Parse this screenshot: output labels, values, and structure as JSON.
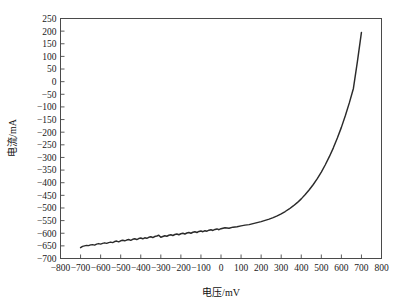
{
  "figure": {
    "background_color": "#ffffff",
    "frame_color": "#4a4a4a",
    "curve_color": "#2b2b2b"
  },
  "chart_data": {
    "type": "line",
    "title": "",
    "xlabel": "电压/mV",
    "ylabel": "电流/mA",
    "xlim": [
      -800,
      800
    ],
    "ylim": [
      -700,
      250
    ],
    "grid": false,
    "legend": null,
    "xticks": [
      -800,
      -700,
      -600,
      -500,
      -400,
      -300,
      -200,
      -100,
      0,
      100,
      200,
      300,
      400,
      500,
      600,
      700,
      800
    ],
    "yticks": [
      -700,
      -650,
      -600,
      -550,
      -500,
      -450,
      -400,
      -350,
      -300,
      -250,
      -200,
      -150,
      -100,
      -50,
      0,
      50,
      100,
      150,
      200,
      250
    ],
    "xtick_labels": [
      "-800",
      "-700",
      "-600",
      "-500",
      "-400",
      "-300",
      "-200",
      "-100",
      "0",
      "100",
      "200",
      "300",
      "400",
      "500",
      "600",
      "700",
      "800"
    ],
    "ytick_labels": [
      "-700",
      "-650",
      "-600",
      "-550",
      "-500",
      "-450",
      "-400",
      "-350",
      "-300",
      "-250",
      "-200",
      "-150",
      "-100",
      "-50",
      "0",
      "50",
      "100",
      "150",
      "200",
      "250"
    ],
    "series": [
      {
        "name": "I-V curve",
        "color": "#2b2b2b",
        "x": [
          -700,
          -690,
          -680,
          -670,
          -660,
          -650,
          -640,
          -630,
          -620,
          -610,
          -600,
          -590,
          -580,
          -570,
          -560,
          -550,
          -540,
          -530,
          -520,
          -510,
          -500,
          -490,
          -480,
          -470,
          -460,
          -450,
          -440,
          -430,
          -420,
          -410,
          -400,
          -390,
          -380,
          -370,
          -360,
          -350,
          -340,
          -330,
          -320,
          -310,
          -300,
          -290,
          -280,
          -270,
          -260,
          -250,
          -240,
          -230,
          -220,
          -210,
          -200,
          -190,
          -180,
          -170,
          -160,
          -150,
          -140,
          -130,
          -120,
          -110,
          -100,
          -90,
          -80,
          -70,
          -60,
          -50,
          -40,
          -30,
          -20,
          -10,
          0,
          20,
          40,
          60,
          80,
          100,
          120,
          140,
          160,
          180,
          200,
          220,
          240,
          260,
          280,
          300,
          320,
          340,
          360,
          380,
          400,
          420,
          440,
          460,
          480,
          500,
          520,
          540,
          560,
          580,
          600,
          620,
          640,
          660,
          680,
          700
        ],
        "y": [
          -657,
          -652,
          -650,
          -648,
          -649,
          -646,
          -645,
          -647,
          -643,
          -641,
          -643,
          -640,
          -638,
          -640,
          -637,
          -635,
          -637,
          -633,
          -631,
          -634,
          -630,
          -628,
          -630,
          -627,
          -625,
          -628,
          -624,
          -622,
          -625,
          -621,
          -619,
          -622,
          -618,
          -620,
          -616,
          -614,
          -617,
          -613,
          -611,
          -608,
          -616,
          -613,
          -610,
          -612,
          -608,
          -606,
          -609,
          -605,
          -603,
          -606,
          -602,
          -600,
          -603,
          -599,
          -597,
          -600,
          -596,
          -594,
          -597,
          -593,
          -591,
          -594,
          -590,
          -592,
          -588,
          -586,
          -589,
          -585,
          -583,
          -586,
          -582,
          -578,
          -580,
          -576,
          -574,
          -571,
          -568,
          -566,
          -562,
          -558,
          -554,
          -549,
          -544,
          -538,
          -531,
          -523,
          -514,
          -504,
          -492,
          -479,
          -464,
          -447,
          -428,
          -407,
          -384,
          -358,
          -329,
          -297,
          -262,
          -223,
          -181,
          -134,
          -83,
          -27,
          80,
          195
        ]
      }
    ],
    "annotations": []
  }
}
